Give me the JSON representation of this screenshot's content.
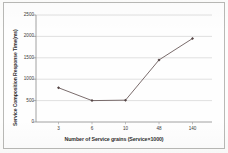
{
  "figure": {
    "border_color": "#b9b9b6",
    "background": "#fefefe"
  },
  "chart_data": {
    "type": "line",
    "title": "",
    "xlabel": "Number of Service grains (Service×1000)",
    "ylabel": "Service Composition Response Time(ms)",
    "categories": [
      "3",
      "6",
      "10",
      "48",
      "140"
    ],
    "values": [
      800,
      500,
      510,
      1450,
      1950
    ],
    "series": [
      {
        "name": "Service Composition Response Time",
        "values": [
          800,
          500,
          510,
          1450,
          1950
        ],
        "line_color": "#6b5b5b",
        "marker_color": "#554545",
        "marker": "diamond"
      }
    ],
    "ylim": [
      0,
      2500
    ],
    "yticks": [
      0,
      500,
      1000,
      1500,
      2000,
      2500
    ],
    "ytick_labels": [
      "0",
      "500",
      "1000",
      "1500",
      "2000",
      "2500"
    ],
    "xtick_labels": [
      "3",
      "6",
      "10",
      "48",
      "140"
    ],
    "grid": "horizontal",
    "grid_color": "#c8c8c8",
    "legend": "none",
    "axis_color": "#8a8a8a"
  }
}
